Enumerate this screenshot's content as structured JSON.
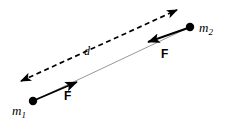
{
  "figure": {
    "background_color": "#ffffff",
    "width": 225,
    "height": 123
  },
  "labels": {
    "mass1_symbol": "m",
    "mass1_subscript": "1",
    "mass2_symbol": "m",
    "mass2_subscript": "2",
    "distance": "d",
    "force_on_mass1": "F",
    "force_on_mass2": "F"
  },
  "colors": {
    "stroke": "#000000",
    "connector": "#8c8c8c",
    "text": "#000000"
  },
  "elements": {
    "mass1_point": {
      "cx": 33,
      "cy": 101,
      "r": 4.2
    },
    "mass2_point": {
      "cx": 190,
      "cy": 27,
      "r": 4.2
    },
    "connector_line": {
      "x1": 33,
      "y1": 101,
      "x2": 190,
      "y2": 27
    },
    "distance_arrow": {
      "x1": 21,
      "y1": 81,
      "x2": 177,
      "y2": 10,
      "style": "dashed",
      "heads": "both",
      "dash_pattern": "5,3.5"
    },
    "force_arrow_mass1": {
      "x1": 33,
      "y1": 101,
      "x2": 79,
      "y2": 81,
      "heads": "end"
    },
    "force_arrow_mass2": {
      "x1": 190,
      "y1": 27,
      "x2": 146,
      "y2": 43,
      "heads": "end"
    }
  }
}
